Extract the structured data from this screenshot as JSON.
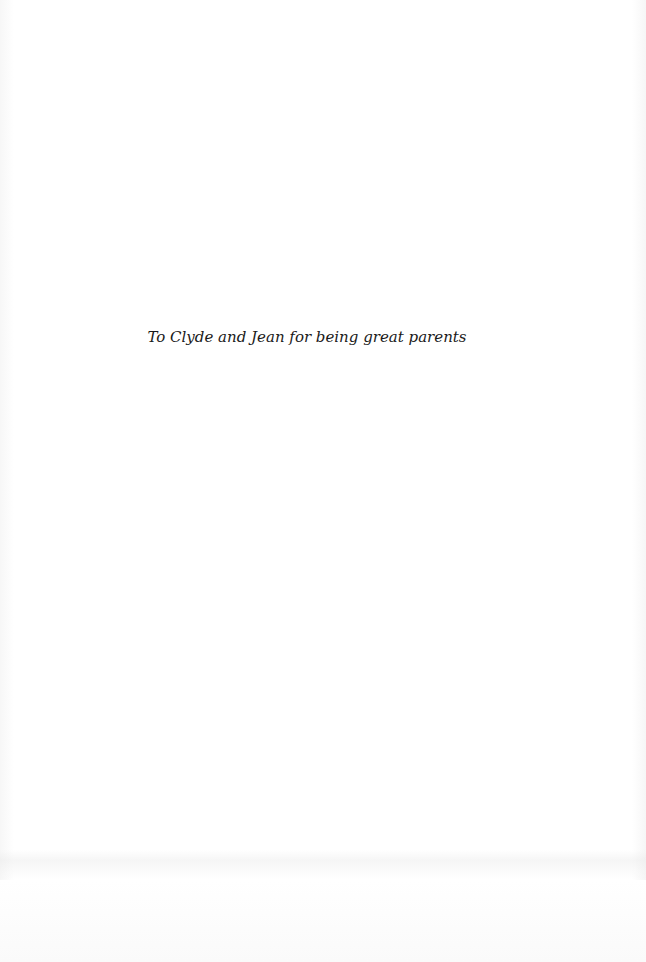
{
  "page": {
    "dedication": "To Clyde and Jean for being great parents",
    "colors": {
      "paper": "#ffffff",
      "text": "#1a1a1a"
    }
  }
}
